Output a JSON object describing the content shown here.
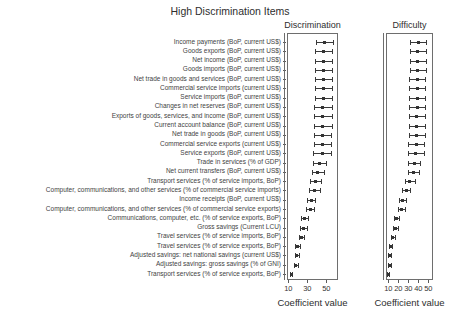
{
  "title": "High Discrimination Items",
  "chart_data": {
    "type": "scatter",
    "subtype": "dotplot-with-error-bars",
    "orientation": "horizontal",
    "xlabel": "Coefficient value",
    "grid": false,
    "legend_position": "none",
    "categories": [
      "Income payments (BoP, current US$)",
      "Goods exports (BoP, current US$)",
      "Net income (BoP, current US$)",
      "Goods imports (BoP, current US$)",
      "Net trade in goods and services (BoP, current US$)",
      "Commercial service imports (current US$)",
      "Service imports (BoP, current US$)",
      "Changes in net reserves (BoP, current US$)",
      "Exports of goods, services, and income (BoP, current US$)",
      "Current account balance (BoP, current US$)",
      "Net trade in goods (BoP, current US$)",
      "Commercial service exports (current US$)",
      "Service exports (BoP, current US$)",
      "Trade in services (% of GDP)",
      "Net current transfers (BoP, current US$)",
      "Transport services (% of service imports, BoP)",
      "Computer, communications, and other services (% of commercial service imports)",
      "Income receipts (BoP, current US$)",
      "Computer, communications, and other services (% of commercial service exports)",
      "Communications, computer, etc. (% of service exports, BoP)",
      "Gross savings (Current LCU)",
      "Travel services (% of service imports, BoP)",
      "Travel services (% of service exports, BoP)",
      "Adjusted savings: net national savings (current US$)",
      "Adjusted savings: gross savings (% of GNI)",
      "Transport services (% of service exports, BoP)"
    ],
    "series": [
      {
        "name": "Discrimination",
        "values": [
          48,
          47.5,
          47.5,
          47,
          47,
          47,
          47,
          46.5,
          46.5,
          46.5,
          46,
          46,
          45.5,
          43,
          41,
          38.5,
          37.5,
          34,
          33,
          27,
          26,
          24,
          20,
          19,
          18,
          13
        ],
        "error": [
          9,
          9,
          9,
          9,
          9,
          9,
          9,
          9,
          9,
          9,
          9,
          9,
          9,
          7,
          6.5,
          6,
          5.5,
          4.5,
          4.5,
          3.5,
          3.5,
          3,
          2.5,
          2,
          2,
          1
        ],
        "xticks": [
          10,
          30,
          50
        ],
        "xlim": [
          8,
          63
        ]
      },
      {
        "name": "Difficulty",
        "values": [
          40,
          39.5,
          39.5,
          39.5,
          39,
          39,
          39,
          39,
          38.5,
          38.5,
          38.5,
          38,
          37.5,
          36,
          35,
          31.5,
          28,
          24,
          23,
          18,
          17,
          14.5,
          12,
          11.5,
          11,
          10
        ],
        "error": [
          8,
          8,
          8,
          8,
          8,
          8,
          8,
          8,
          8,
          8,
          8,
          8,
          8,
          6,
          5.5,
          5,
          4,
          3.5,
          3.5,
          2.5,
          2.5,
          2,
          1.5,
          1.5,
          1.5,
          1
        ],
        "xticks": [
          10,
          20,
          30,
          40,
          50
        ],
        "xlim": [
          8,
          57
        ]
      }
    ],
    "marker": "filled-square-with-whiskers",
    "colors": {
      "marker": "#333333",
      "frame": "#6e6e6e",
      "text": "#3a3a3a"
    }
  }
}
